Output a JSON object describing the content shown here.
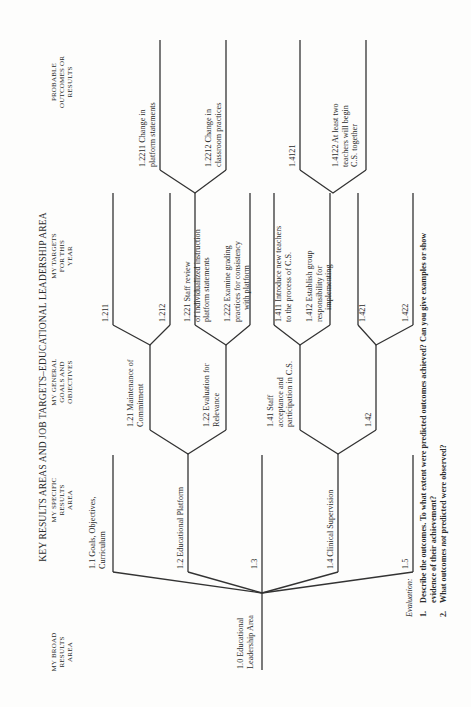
{
  "title": "KEY RESULTS AREAS AND JOB TARGETS–EDUCATIONAL LEADERSHIP AREA",
  "columns": [
    {
      "lines": [
        "MY BROAD",
        "RESULTS",
        "AREA"
      ]
    },
    {
      "lines": [
        "MY SPECIFIC",
        "RESULTS",
        "AREA"
      ]
    },
    {
      "lines": [
        "MY GENERAL",
        "GOALS AND",
        "OBJECTIVES"
      ]
    },
    {
      "lines": [
        "MY TARGETS",
        "FOR THIS",
        "YEAR"
      ]
    },
    {
      "lines": [
        "PROBABLE",
        "OUTCOMES OR",
        "RESULTS"
      ]
    }
  ],
  "tree": {
    "root": {
      "lines": [
        "1.0  Educational",
        "Leadership Area"
      ]
    },
    "level1": [
      {
        "id": "1.1",
        "lines": [
          "1.1  Goals, Objectives,",
          "Curriculum"
        ]
      },
      {
        "id": "1.2",
        "lines": [
          "1.2  Educational Platform"
        ]
      },
      {
        "id": "1.3",
        "lines": [
          "1.3"
        ]
      },
      {
        "id": "1.4",
        "lines": [
          "1.4  Clinical Supervision"
        ]
      },
      {
        "id": "1.5",
        "lines": [
          "1.5"
        ]
      }
    ],
    "level2": [
      {
        "id": "1.21",
        "lines": [
          "1.21  Maintenance of",
          "Commitment"
        ]
      },
      {
        "id": "1.22",
        "lines": [
          "1.22  Evaluation for",
          "Relevance"
        ]
      },
      {
        "id": "1.41",
        "lines": [
          "1.41  Staff",
          "acceptance and",
          "participation in C.S."
        ]
      },
      {
        "id": "1.42",
        "lines": [
          "1.42"
        ]
      }
    ],
    "level3": [
      {
        "id": "1.211",
        "lines": [
          "1.211"
        ]
      },
      {
        "id": "1.212",
        "lines": [
          "1.212"
        ]
      },
      {
        "id": "1.221",
        "lines": [
          "1.221  Staff review",
          "of individualized instruction",
          "platform statements"
        ]
      },
      {
        "id": "1.222",
        "lines": [
          "1.222  Examine grading",
          "practices for consistency",
          "with platform"
        ]
      },
      {
        "id": "1.411",
        "lines": [
          "1.411  Introduce new teachers",
          "to the process of C.S."
        ]
      },
      {
        "id": "1.412",
        "lines": [
          "1.412  Establish group",
          "responsibility for",
          "implementing"
        ]
      },
      {
        "id": "1.421",
        "lines": [
          "1.421"
        ]
      },
      {
        "id": "1.422",
        "lines": [
          "1.422"
        ]
      }
    ],
    "level4": [
      {
        "id": "1.2211",
        "lines": [
          "1.2211  Change in",
          "platform statements"
        ]
      },
      {
        "id": "1.2212",
        "lines": [
          "1.2212  Change in",
          "classroom practices"
        ]
      },
      {
        "id": "1.4121",
        "lines": [
          "1.4121"
        ]
      },
      {
        "id": "1.4122",
        "lines": [
          "1.4122  At least two",
          "teachers will begin",
          "C.S. together"
        ]
      }
    ]
  },
  "evaluation": {
    "heading": "Evaluation:",
    "items": [
      {
        "num": "1.",
        "lines": [
          "Describe the outcomes. To what extent were predicted outcomes achieved? Can you give examples or show",
          "evidence of their achievement?"
        ]
      },
      {
        "num": "2.",
        "pre": "What outcomes ",
        "em": "not",
        "post": " predicted were observed?"
      }
    ]
  }
}
